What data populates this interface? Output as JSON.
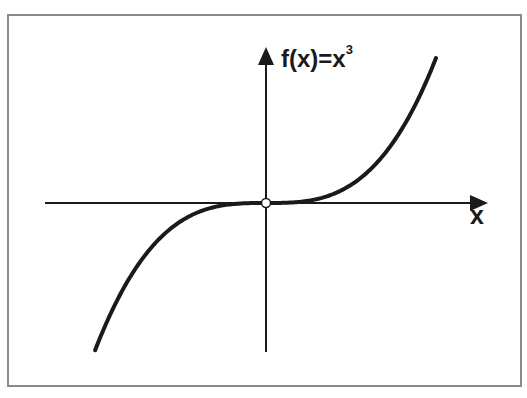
{
  "chart_data": {
    "type": "line",
    "title": "",
    "function": "f(x)=x^3",
    "ylabel_base": "f(x)=x",
    "ylabel_exponent": "3",
    "xlabel": "x",
    "x": [
      -1.0,
      -0.8,
      -0.6,
      -0.4,
      -0.2,
      0.0,
      0.2,
      0.4,
      0.6,
      0.8,
      1.0
    ],
    "series": [
      {
        "name": "f(x)=x^3",
        "values": [
          -0.97,
          -0.5,
          -0.21,
          -0.06,
          -0.008,
          0.0,
          0.008,
          0.06,
          0.21,
          0.5,
          1.0
        ]
      }
    ],
    "xlim": [
      -1.3,
      1.25
    ],
    "ylim": [
      -1.0,
      1.1
    ],
    "grid": false,
    "legend": "none",
    "ticks": "none",
    "origin_marker": "open-circle",
    "colors": {
      "curve": "#1a1a1a",
      "axes": "#1a1a1a",
      "frame": "#8a8a8a",
      "background": "#ffffff"
    }
  }
}
